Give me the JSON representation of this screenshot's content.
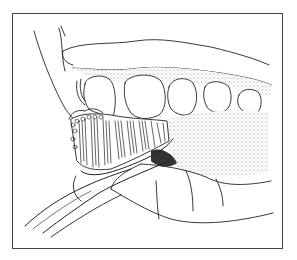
{
  "illustration": {
    "subject": "toothbrush brushing upper teeth",
    "style": "black and white line art",
    "colors": {
      "background": "#ffffff",
      "line": "#222222",
      "frame": "#444444",
      "stipple": "#9a9a9a",
      "shadow": "#333333"
    }
  }
}
